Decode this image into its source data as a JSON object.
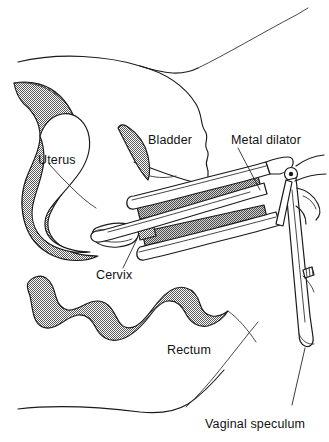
{
  "figure": {
    "kind": "medical-line-illustration",
    "view": "sagittal section of female pelvis",
    "background_color": "#ffffff",
    "ink_color": "#1a1a1a",
    "shade_color": "#8a8a8a"
  },
  "labels": {
    "uterus": "Uterus",
    "bladder": "Bladder",
    "cervix": "Cervix",
    "rectum": "Rectum",
    "metal_dilator": "Metal dilator",
    "vaginal_speculum": "Vaginal speculum"
  },
  "structures": [
    {
      "name": "uterus",
      "label": "Uterus",
      "fill": "stipple",
      "has_leader": false
    },
    {
      "name": "bladder",
      "label": "Bladder",
      "fill": "stipple",
      "has_leader": false
    },
    {
      "name": "cervix",
      "label": "Cervix",
      "fill": "white",
      "has_leader": true
    },
    {
      "name": "rectum",
      "label": "Rectum",
      "fill": "stipple",
      "has_leader": false
    },
    {
      "name": "vaginal-wall",
      "label": "",
      "fill": "stipple",
      "has_leader": false
    }
  ],
  "instruments": [
    {
      "name": "metal-dilator",
      "label": "Metal dilator",
      "has_leader": true
    },
    {
      "name": "vaginal-speculum",
      "label": "Vaginal speculum",
      "has_leader": true
    }
  ]
}
